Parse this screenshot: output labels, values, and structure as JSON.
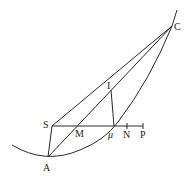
{
  "diagram": {
    "type": "geometric-construction",
    "colors": {
      "line": "#2a2a2a",
      "text": "#222222",
      "background": "#ffffff"
    },
    "points": {
      "C": {
        "label": "C",
        "x": 172,
        "y": 26
      },
      "S": {
        "label": "S",
        "x": 52,
        "y": 126
      },
      "A": {
        "label": "A",
        "x": 48,
        "y": 157
      },
      "M": {
        "label": "M",
        "x": 78,
        "y": 126
      },
      "I": {
        "label": "I",
        "x": 111,
        "y": 90
      },
      "mu": {
        "label": "μ",
        "x": 114,
        "y": 126
      },
      "N": {
        "label": "N",
        "x": 127,
        "y": 126
      },
      "P": {
        "label": "P",
        "x": 143,
        "y": 126
      }
    },
    "segments": [
      "S–C",
      "A–C",
      "S–A",
      "S–P",
      "I–μ",
      "M–I (part of A–C)"
    ],
    "curve": "parabola through A, μ and C"
  }
}
